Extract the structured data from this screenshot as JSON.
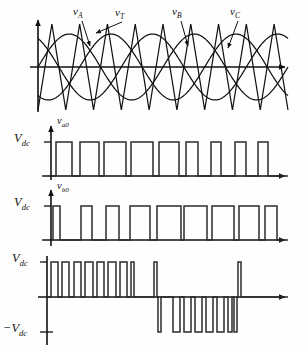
{
  "figure": {
    "background": "#fefefe",
    "stroke": "#111111",
    "width": 307,
    "height": 351
  },
  "labels": {
    "vA": "v",
    "vA_sub": "A",
    "vT": "v",
    "vT_sub": "T",
    "vB": "v",
    "vB_sub": "B",
    "vC": "v",
    "vC_sub": "C",
    "vaO": "v",
    "vaO_sub": "a0",
    "vbO": "v",
    "vbO_sub": "b0",
    "Vdc1": "V",
    "Vdc1_sub": "dc",
    "Vdc2": "V",
    "Vdc2_sub": "dc",
    "Vdc3": "V",
    "Vdc3_sub": "dc",
    "negVdc": "−V",
    "negVdc_sub": "dc"
  },
  "chart_data": {
    "type": "line",
    "xlabel": "",
    "ylabel": "",
    "grid": false,
    "legend": "inline annotations",
    "panels": [
      {
        "name": "carrier-and-references",
        "ylabel": "",
        "axis_origin_x": 38,
        "zero_line_y": 67,
        "x_range": [
          38,
          288
        ],
        "series": [
          {
            "name": "v_T",
            "kind": "triangular-carrier",
            "label": "v_T",
            "amplitude": 43,
            "cycles": 9,
            "phase_deg": 0,
            "description": "high-frequency triangular carrier wave"
          },
          {
            "name": "v_A",
            "kind": "sine-reference",
            "label": "v_A",
            "amplitude": 33,
            "cycles": 2,
            "phase_deg": 0,
            "description": "phase A sinusoidal modulating reference"
          },
          {
            "name": "v_B",
            "kind": "sine-reference",
            "label": "v_B",
            "amplitude": 33,
            "cycles": 2,
            "phase_deg": -120,
            "description": "phase B sinusoidal modulating reference"
          },
          {
            "name": "v_C",
            "kind": "sine-reference",
            "label": "v_C",
            "amplitude": 33,
            "cycles": 2,
            "phase_deg": -240,
            "description": "phase C sinusoidal modulating reference"
          }
        ],
        "annotations": [
          {
            "text": "v_A",
            "x": 77,
            "y": 10,
            "arrow_to": [
              88,
              45
            ]
          },
          {
            "text": "v_T",
            "x": 118,
            "y": 10,
            "arrow_to": [
              96,
              33
            ]
          },
          {
            "text": "v_B",
            "x": 176,
            "y": 10,
            "arrow_to": [
              184,
              46
            ]
          },
          {
            "text": "v_C",
            "x": 232,
            "y": 10,
            "arrow_to": [
              224,
              48
            ]
          }
        ]
      },
      {
        "name": "v_a0",
        "ylabel": "v_a0",
        "axis_origin_x": 51,
        "baseline_y": 176,
        "high_y": 142,
        "high_value_label": "V_dc",
        "low_value": 0,
        "x_range": [
          51,
          288
        ],
        "pulses": [
          {
            "start": 56,
            "end": 72
          },
          {
            "start": 80,
            "end": 99
          },
          {
            "start": 104,
            "end": 126
          },
          {
            "start": 131,
            "end": 153
          },
          {
            "start": 159,
            "end": 179
          },
          {
            "start": 186,
            "end": 198
          },
          {
            "start": 211,
            "end": 221
          },
          {
            "start": 235,
            "end": 246
          },
          {
            "start": 258,
            "end": 268
          }
        ]
      },
      {
        "name": "v_b0",
        "ylabel": "v_b0",
        "axis_origin_x": 51,
        "baseline_y": 240,
        "high_y": 206,
        "high_value_label": "V_dc",
        "low_value": 0,
        "x_range": [
          51,
          288
        ],
        "pulses": [
          {
            "start": 53,
            "end": 60
          },
          {
            "start": 81,
            "end": 92
          },
          {
            "start": 106,
            "end": 119
          },
          {
            "start": 130,
            "end": 150
          },
          {
            "start": 157,
            "end": 181
          },
          {
            "start": 184,
            "end": 207
          },
          {
            "start": 212,
            "end": 234
          },
          {
            "start": 239,
            "end": 259
          },
          {
            "start": 265,
            "end": 277
          }
        ]
      },
      {
        "name": "v_ab",
        "ylabel": "",
        "axis_origin_x": 47,
        "zero_line_y": 297,
        "high_y": 262,
        "low_y": 332,
        "high_value_label": "V_dc",
        "low_value_label": "-V_dc",
        "x_range": [
          47,
          288
        ],
        "positive_pulses": [
          {
            "start": 51,
            "end": 58
          },
          {
            "start": 62,
            "end": 69
          },
          {
            "start": 74,
            "end": 81
          },
          {
            "start": 85,
            "end": 93
          },
          {
            "start": 97,
            "end": 104
          },
          {
            "start": 108,
            "end": 116
          },
          {
            "start": 120,
            "end": 127
          },
          {
            "start": 131,
            "end": 134
          },
          {
            "start": 154,
            "end": 157
          },
          {
            "start": 238,
            "end": 241
          }
        ],
        "negative_pulses": [
          {
            "start": 158,
            "end": 161
          },
          {
            "start": 173,
            "end": 180
          },
          {
            "start": 184,
            "end": 191
          },
          {
            "start": 195,
            "end": 202
          },
          {
            "start": 206,
            "end": 213
          },
          {
            "start": 217,
            "end": 224
          },
          {
            "start": 228,
            "end": 232
          },
          {
            "start": 234,
            "end": 237
          }
        ]
      }
    ]
  }
}
